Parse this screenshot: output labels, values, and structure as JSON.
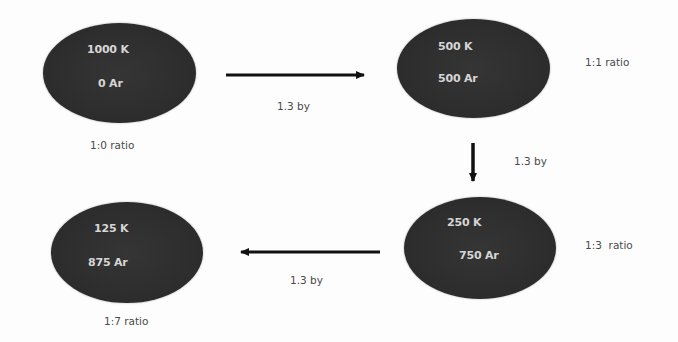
{
  "diagram": {
    "type": "flow",
    "nodes": [
      {
        "id": "n1",
        "line1": "1000 K",
        "line2": "0 Ar",
        "ratio": "1:0 ratio"
      },
      {
        "id": "n2",
        "line1": "500 K",
        "line2": "500 Ar",
        "ratio": "1:1 ratio"
      },
      {
        "id": "n3",
        "line1": "250 K",
        "line2": "750 Ar",
        "ratio": "1:3  ratio"
      },
      {
        "id": "n4",
        "line1": "125 K",
        "line2": "875 Ar",
        "ratio": "1:7 ratio"
      }
    ],
    "edges": [
      {
        "from": "n1",
        "to": "n2",
        "direction": "right",
        "label": "1.3 by"
      },
      {
        "from": "n2",
        "to": "n3",
        "direction": "down",
        "label": "1.3 by"
      },
      {
        "from": "n3",
        "to": "n4",
        "direction": "left",
        "label": "1.3 by"
      }
    ],
    "colors": {
      "node_fill": "#2e2e2e",
      "node_text": "#d6d6d6",
      "label_text": "#4a4a4a",
      "arrow": "#111111"
    }
  }
}
